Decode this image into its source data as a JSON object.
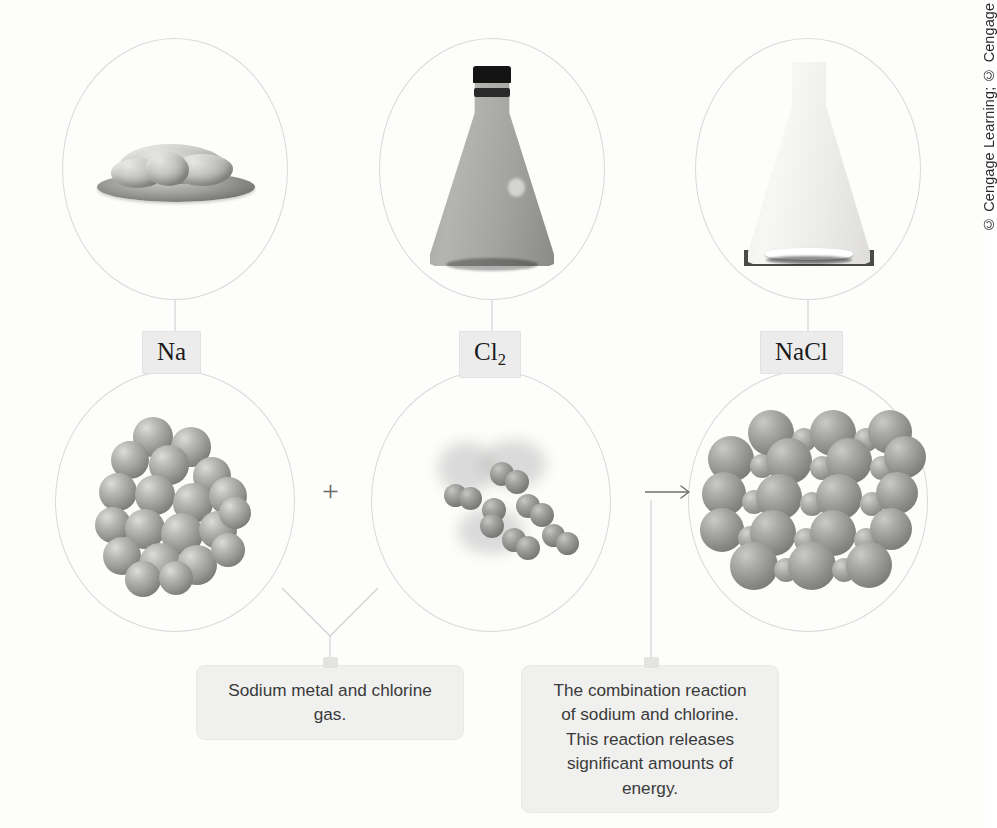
{
  "figure": {
    "type": "chemistry-reaction-diagram"
  },
  "labels": [
    {
      "id": "na",
      "text": "Na",
      "formula_base": "Na",
      "formula_sub": ""
    },
    {
      "id": "cl2",
      "text": "Cl2",
      "formula_base": "Cl",
      "formula_sub": "2"
    },
    {
      "id": "nacl",
      "text": "NaCl",
      "formula_base": "NaCl",
      "formula_sub": ""
    }
  ],
  "macro_row": {
    "items": [
      {
        "id": "na-photo",
        "alt": "Chunks of sodium metal on a watch glass"
      },
      {
        "id": "cl2-photo",
        "alt": "Stoppered Erlenmeyer flask filled with yellow-green chlorine gas"
      },
      {
        "id": "nacl-photo",
        "alt": "Erlenmeyer flask containing white sodium chloride solid"
      }
    ]
  },
  "micro_row": {
    "items": [
      {
        "id": "na-model",
        "alt": "Cluster of sodium atoms in a metallic lattice"
      },
      {
        "id": "cl2-model",
        "alt": "Six diatomic chlorine molecules in the gas phase"
      },
      {
        "id": "nacl-model",
        "alt": "Sodium chloride ionic crystal lattice of alternating ions"
      }
    ]
  },
  "operators": {
    "plus": "+",
    "arrow": "→"
  },
  "captions": [
    {
      "id": "reactants-caption",
      "lines": [
        "Sodium metal and chlorine",
        "gas."
      ],
      "text": "Sodium metal and chlorine gas."
    },
    {
      "id": "reaction-caption",
      "lines": [
        "The combination reaction",
        "of sodium and chlorine.",
        "This reaction releases",
        "significant amounts of",
        "energy."
      ],
      "text": "The combination reaction of sodium and chlorine. This reaction releases significant amounts of energy."
    }
  ],
  "credit": {
    "text": "© Cengage Learning; © Cengage Learning/Melissa Kelly Photography"
  },
  "colors": {
    "page_background": "#fdfdfc",
    "circle_outline": "#d9d9da",
    "chip_fill": "#ececed",
    "caption_fill": "#f0f0ef",
    "line": "#cfcfd0",
    "text": "#3a3a3a"
  }
}
